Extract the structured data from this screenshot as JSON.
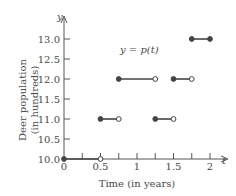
{
  "chart_data": {
    "type": "line",
    "subtype": "step",
    "title": "",
    "function_label": "y = p(t)",
    "xlabel": "Time (in years)",
    "ylabel": "Deer population (in hundreds)",
    "ylabel_line1": "Deer population",
    "ylabel_line2": "(in hundreds)",
    "x_axis_var": "t",
    "y_axis_var": "y",
    "xlim": [
      0,
      2
    ],
    "ylim": [
      10.0,
      13.0
    ],
    "x_ticks": [
      "0",
      "0.5",
      "1",
      "1.5",
      "2"
    ],
    "x_tick_values": [
      0,
      0.25,
      0.5,
      0.75,
      1,
      1.25,
      1.5,
      1.75,
      2
    ],
    "y_ticks": [
      "10.0",
      "10.5",
      "11.0",
      "11.5",
      "12.0",
      "12.5",
      "13.0"
    ],
    "grid": false,
    "segments": [
      {
        "x_start": 0,
        "x_end": 0.5,
        "y": 10.0,
        "start_closed": true,
        "end_closed": false
      },
      {
        "x_start": 0.5,
        "x_end": 0.75,
        "y": 11.0,
        "start_closed": true,
        "end_closed": false
      },
      {
        "x_start": 0.75,
        "x_end": 1.25,
        "y": 12.0,
        "start_closed": true,
        "end_closed": false
      },
      {
        "x_start": 1.25,
        "x_end": 1.5,
        "y": 11.0,
        "start_closed": true,
        "end_closed": false
      },
      {
        "x_start": 1.5,
        "x_end": 1.75,
        "y": 12.0,
        "start_closed": true,
        "end_closed": false
      },
      {
        "x_start": 1.75,
        "x_end": 2.0,
        "y": 13.0,
        "start_closed": true,
        "end_closed": true
      }
    ]
  },
  "colors": {
    "axis": "#555555",
    "line": "#444444",
    "text": "#4a4a4a"
  }
}
